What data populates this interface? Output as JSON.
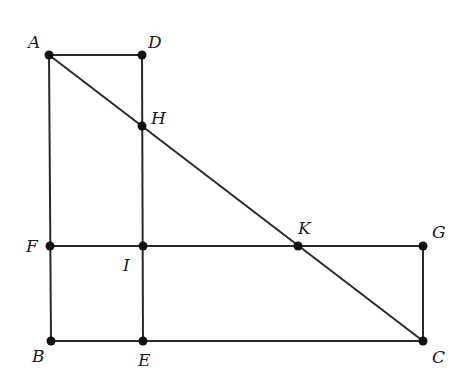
{
  "diagram": {
    "type": "geometry-figure",
    "points": [
      {
        "name": "A",
        "x": 49,
        "y": 55,
        "label_x": 28,
        "label_y": 48
      },
      {
        "name": "D",
        "x": 142,
        "y": 55,
        "label_x": 148,
        "label_y": 48
      },
      {
        "name": "H",
        "x": 142,
        "y": 126,
        "label_x": 151,
        "label_y": 124
      },
      {
        "name": "F",
        "x": 50,
        "y": 246,
        "label_x": 26,
        "label_y": 252
      },
      {
        "name": "I",
        "x": 143,
        "y": 246,
        "label_x": 123,
        "label_y": 271
      },
      {
        "name": "K",
        "x": 298,
        "y": 246,
        "label_x": 298,
        "label_y": 234
      },
      {
        "name": "G",
        "x": 423,
        "y": 246,
        "label_x": 432,
        "label_y": 238
      },
      {
        "name": "B",
        "x": 51,
        "y": 341,
        "label_x": 32,
        "label_y": 362
      },
      {
        "name": "E",
        "x": 143,
        "y": 341,
        "label_x": 138,
        "label_y": 366
      },
      {
        "name": "C",
        "x": 423,
        "y": 341,
        "label_x": 432,
        "label_y": 363
      }
    ],
    "segments": [
      [
        "A",
        "D"
      ],
      [
        "A",
        "B"
      ],
      [
        "D",
        "E"
      ],
      [
        "A",
        "C"
      ],
      [
        "F",
        "G"
      ],
      [
        "B",
        "C"
      ],
      [
        "G",
        "C"
      ]
    ],
    "colors": {
      "line": "#2a2a2a",
      "point": "#111111",
      "background": "#ffffff"
    }
  },
  "labels": {
    "A": "A",
    "B": "B",
    "C": "C",
    "D": "D",
    "E": "E",
    "F": "F",
    "G": "G",
    "H": "H",
    "I": "I",
    "K": "K"
  }
}
